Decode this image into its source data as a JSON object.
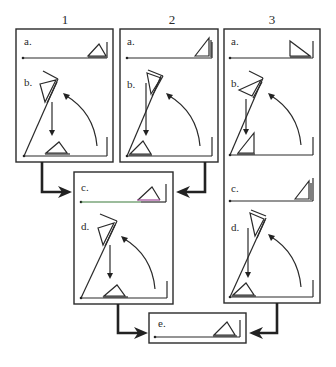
{
  "columns": [
    {
      "label": "1"
    },
    {
      "label": "2"
    },
    {
      "label": "3"
    }
  ],
  "panels": {
    "p1": {
      "top_label": "a.",
      "bottom_label": "b."
    },
    "p2": {
      "top_label": "a.",
      "bottom_label": "b."
    },
    "p3": {
      "top_label": "a.",
      "bottom_label": "b.",
      "mid_top_label": "c.",
      "mid_bottom_label": "d."
    },
    "center": {
      "top_label": "c.",
      "bottom_label": "d."
    },
    "final": {
      "label": "e."
    }
  },
  "colors": {
    "stroke": "#2a2a2a",
    "accent_green": "#3a7a3a",
    "accent_magenta": "#a04a9a"
  }
}
